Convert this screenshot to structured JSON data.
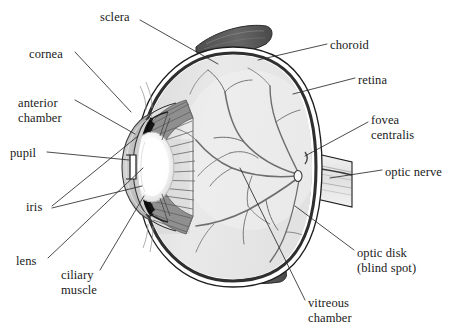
{
  "figure": {
    "type": "labeled-anatomical-diagram",
    "palette": {
      "background": "#ffffff",
      "text": "#1a1a1a",
      "leader_line": "#2b2b2b",
      "sclera_outline": "#1d1d1d",
      "sclera_fill": "#ffffff",
      "choroid_dark": "#2f2f2f",
      "retina_line": "#555555",
      "vitreous_fill": "#e9e9e9",
      "ciliary_body": "#8f8f8f",
      "ciliary_striation": "#6a6a6a",
      "iris_dark": "#151515",
      "lens_fill": "#fdfdfd",
      "lens_rim": "#c9c9c9",
      "cornea_fill": "#b9b9b9",
      "anterior_chamber": "#cfcfcf",
      "muscle_fill": "#5a5a5a",
      "vessel": "#6e6e6e",
      "optic_nerve_fill": "#ededed"
    },
    "labels": [
      {
        "id": "sclera",
        "text": "sclera",
        "x": 100,
        "y": 10,
        "align": "left"
      },
      {
        "id": "cornea",
        "text": "cornea",
        "x": 29,
        "y": 47,
        "align": "left"
      },
      {
        "id": "anterior_chamber",
        "text": "anterior\nchamber",
        "x": 18,
        "y": 96,
        "align": "left"
      },
      {
        "id": "pupil",
        "text": "pupil",
        "x": 10,
        "y": 146,
        "align": "left"
      },
      {
        "id": "iris",
        "text": "iris",
        "x": 26,
        "y": 200,
        "align": "left"
      },
      {
        "id": "lens",
        "text": "lens",
        "x": 16,
        "y": 254,
        "align": "left"
      },
      {
        "id": "ciliary_muscle",
        "text": "ciliary\nmuscle",
        "x": 61,
        "y": 268,
        "align": "left"
      },
      {
        "id": "choroid",
        "text": "choroid",
        "x": 330,
        "y": 38,
        "align": "left"
      },
      {
        "id": "retina",
        "text": "retina",
        "x": 358,
        "y": 73,
        "align": "left"
      },
      {
        "id": "fovea_centralis",
        "text": "fovea\ncentralis",
        "x": 371,
        "y": 113,
        "align": "left"
      },
      {
        "id": "optic_nerve",
        "text": "optic nerve",
        "x": 385,
        "y": 165,
        "align": "left"
      },
      {
        "id": "optic_disk",
        "text": "optic disk\n(blind spot)",
        "x": 357,
        "y": 246,
        "align": "left"
      },
      {
        "id": "vitreous_chamber",
        "text": "vitreous\nchamber",
        "x": 308,
        "y": 296,
        "align": "left"
      }
    ],
    "leaders": [
      {
        "id": "leader-sclera",
        "points": "140,20 218,64"
      },
      {
        "id": "leader-cornea",
        "points": "75,52 131,112"
      },
      {
        "id": "leader-anterior-chamber",
        "points": "75,100 135,134"
      },
      {
        "id": "leader-pupil",
        "points": "47,152 129,160"
      },
      {
        "id": "leader-iris-upper",
        "points": "52,206 138,136"
      },
      {
        "id": "leader-iris-lower",
        "points": "52,208 142,186"
      },
      {
        "id": "leader-lens",
        "points": "48,258 143,168"
      },
      {
        "id": "leader-ciliary-muscle",
        "points": "100,270 144,196"
      },
      {
        "id": "leader-choroid",
        "points": "327,44 258,60"
      },
      {
        "id": "leader-retina",
        "points": "355,78 293,94"
      },
      {
        "id": "leader-fovea",
        "points": "368,122 305,156"
      },
      {
        "id": "leader-optic-nerve",
        "points": "382,170 330,178"
      },
      {
        "id": "leader-optic-disk",
        "points": "354,250 295,206"
      },
      {
        "id": "leader-vitreous",
        "points": "305,300 240,168"
      }
    ]
  }
}
